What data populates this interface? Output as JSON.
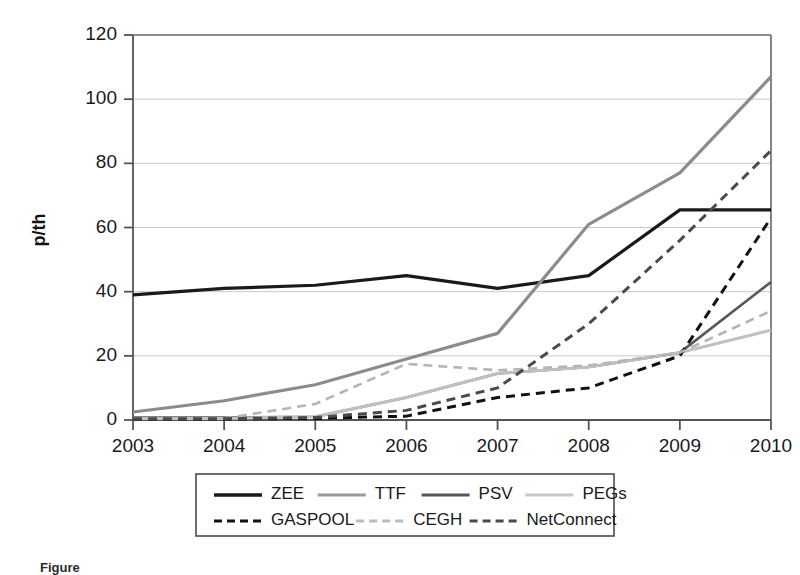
{
  "chart_data": {
    "type": "line",
    "title": "",
    "xlabel": "",
    "ylabel": "p/th",
    "categories": [
      "2003",
      "2004",
      "2005",
      "2006",
      "2007",
      "2008",
      "2009",
      "2010"
    ],
    "x": [
      2003,
      2004,
      2005,
      2006,
      2007,
      2008,
      2009,
      2010
    ],
    "xlim": [
      2003,
      2010
    ],
    "ylim": [
      0,
      120
    ],
    "yticks": [
      0,
      20,
      40,
      60,
      80,
      100,
      120
    ],
    "xticks": [
      "2003",
      "2004",
      "2005",
      "2006",
      "2007",
      "2008",
      "2009",
      "2010"
    ],
    "grid": "horizontal",
    "legend_position": "bottom",
    "series": [
      {
        "name": "ZEE",
        "style": "solid",
        "color": "#1a1a1a",
        "width": 3.2,
        "values": [
          39,
          41,
          42,
          45,
          41,
          45,
          65.5,
          65.5
        ]
      },
      {
        "name": "TTF",
        "style": "solid",
        "color": "#8c8c8c",
        "width": 3.2,
        "values": [
          2.5,
          6,
          11,
          19,
          27,
          61,
          77,
          107
        ]
      },
      {
        "name": "PSV",
        "style": "solid",
        "color": "#585858",
        "width": 2.6,
        "values": [
          0.8,
          0.8,
          1,
          7,
          14.5,
          16.5,
          21,
          43
        ]
      },
      {
        "name": "PEGs",
        "style": "solid",
        "color": "#c0c0c0",
        "width": 3.0,
        "values": [
          0.5,
          0.5,
          1,
          7,
          14.5,
          16.5,
          21,
          28
        ]
      },
      {
        "name": "GASPOOL",
        "style": "dashed",
        "color": "#111111",
        "width": 3.0,
        "values": [
          0.3,
          0.3,
          0.5,
          1.2,
          7,
          10,
          20,
          63
        ]
      },
      {
        "name": "CEGH",
        "style": "dashed",
        "color": "#b5b5b5",
        "width": 2.6,
        "values": [
          0.5,
          0.5,
          5,
          17.5,
          15.5,
          17,
          21,
          34
        ]
      },
      {
        "name": "NetConnect",
        "style": "dashed",
        "color": "#4a4a4a",
        "width": 3.0,
        "values": [
          0.4,
          0.4,
          0.8,
          3,
          10,
          30,
          56,
          84
        ]
      }
    ]
  },
  "axis": {
    "y_title": "p/th",
    "y_tick_labels": [
      "0",
      "20",
      "40",
      "60",
      "80",
      "100",
      "120"
    ],
    "x_tick_labels": [
      "2003",
      "2004",
      "2005",
      "2006",
      "2007",
      "2008",
      "2009",
      "2010"
    ]
  },
  "legend": {
    "row1": [
      {
        "label": "ZEE",
        "style": "solid",
        "color": "#1a1a1a",
        "width": 3.4
      },
      {
        "label": "TTF",
        "style": "solid",
        "color": "#9a9a9a",
        "width": 3.2
      },
      {
        "label": "PSV",
        "style": "solid",
        "color": "#585858",
        "width": 3.0
      },
      {
        "label": "PEGs",
        "style": "solid",
        "color": "#c8c8c8",
        "width": 3.2
      }
    ],
    "row2": [
      {
        "label": "GASPOOL",
        "style": "dashed",
        "color": "#111111",
        "width": 3.2
      },
      {
        "label": "CEGH",
        "style": "dashed",
        "color": "#bcbcbc",
        "width": 2.8
      },
      {
        "label": "NetConnect",
        "style": "dashed",
        "color": "#4a4a4a",
        "width": 3.0
      }
    ]
  },
  "caption": {
    "text": "Figure"
  },
  "colors": {
    "axis": "#555555",
    "grid": "#c8c8c8",
    "frame": "#666666",
    "text": "#1a1a1a"
  }
}
